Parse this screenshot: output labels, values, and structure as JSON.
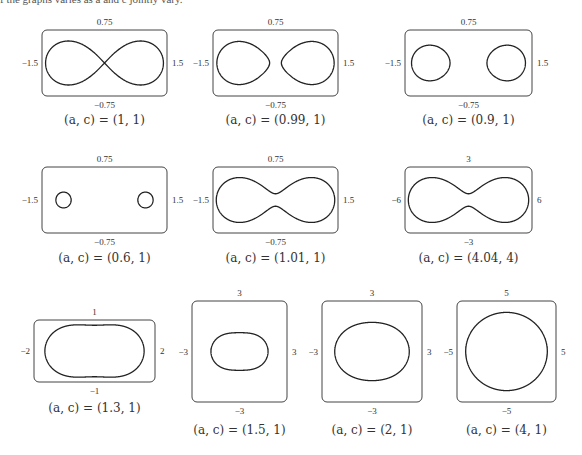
{
  "header": {
    "partial_text": "f the graphs varies as a and c jointly vary."
  },
  "chart_data": [
    {
      "type": "line",
      "title": "(a, c) = (1, 1)",
      "a": 1,
      "c": 1,
      "xlim": [
        -1.5,
        1.5
      ],
      "ylim": [
        -0.75,
        0.75
      ],
      "tick_labels": {
        "left": "−1.5",
        "right": "1.5",
        "top": "0.75",
        "bottom": "−0.75"
      },
      "caption": "(a, c) = (1, 1)"
    },
    {
      "type": "line",
      "title": "(a, c) = (0.99, 1)",
      "a": 0.99,
      "c": 1,
      "xlim": [
        -1.5,
        1.5
      ],
      "ylim": [
        -0.75,
        0.75
      ],
      "tick_labels": {
        "left": "−1.5",
        "right": "1.5",
        "top": "0.75",
        "bottom": "−0.75"
      },
      "caption": "(a, c) = (0.99, 1)"
    },
    {
      "type": "line",
      "title": "(a, c) = (0.9, 1)",
      "a": 0.9,
      "c": 1,
      "xlim": [
        -1.5,
        1.5
      ],
      "ylim": [
        -0.75,
        0.75
      ],
      "tick_labels": {
        "left": "−1.5",
        "right": "1.5",
        "top": "0.75",
        "bottom": "−0.75"
      },
      "caption": "(a, c) = (0.9, 1)"
    },
    {
      "type": "line",
      "title": "(a, c) = (0.6, 1)",
      "a": 0.6,
      "c": 1,
      "xlim": [
        -1.5,
        1.5
      ],
      "ylim": [
        -0.75,
        0.75
      ],
      "tick_labels": {
        "left": "−1.5",
        "right": "1.5",
        "top": "0.75",
        "bottom": "−0.75"
      },
      "caption": "(a, c) = (0.6, 1)"
    },
    {
      "type": "line",
      "title": "(a, c) = (1.01, 1)",
      "a": 1.01,
      "c": 1,
      "xlim": [
        -1.5,
        1.5
      ],
      "ylim": [
        -0.75,
        0.75
      ],
      "tick_labels": {
        "left": "−1.5",
        "right": "1.5",
        "top": "0.75",
        "bottom": "−0.75"
      },
      "caption": "(a, c) = (1.01, 1)"
    },
    {
      "type": "line",
      "title": "(a, c) = (4.04, 4)",
      "a": 4.04,
      "c": 4,
      "xlim": [
        -6,
        6
      ],
      "ylim": [
        -3,
        3
      ],
      "tick_labels": {
        "left": "−6",
        "right": "6",
        "top": "3",
        "bottom": "−3"
      },
      "caption": "(a, c) = (4.04, 4)"
    },
    {
      "type": "line",
      "title": "(a, c) = (1.3, 1)",
      "a": 1.3,
      "c": 1,
      "xlim": [
        -2,
        2
      ],
      "ylim": [
        -1,
        1
      ],
      "tick_labels": {
        "left": "−2",
        "right": "2",
        "top": "1",
        "bottom": "−1"
      },
      "caption": "(a, c) = (1.3, 1)"
    },
    {
      "type": "line",
      "title": "(a, c) = (1.5, 1)",
      "a": 1.5,
      "c": 1,
      "xlim": [
        -3,
        3
      ],
      "ylim": [
        -3,
        3
      ],
      "tick_labels": {
        "left": "−3",
        "right": "3",
        "top": "3",
        "bottom": "−3"
      },
      "caption": "(a, c) = (1.5, 1)"
    },
    {
      "type": "line",
      "title": "(a, c) = (2, 1)",
      "a": 2,
      "c": 1,
      "xlim": [
        -3,
        3
      ],
      "ylim": [
        -3,
        3
      ],
      "tick_labels": {
        "left": "−3",
        "right": "3",
        "top": "3",
        "bottom": "−3"
      },
      "caption": "(a, c) = (2, 1)"
    },
    {
      "type": "line",
      "title": "(a, c) = (4, 1)",
      "a": 4,
      "c": 1,
      "xlim": [
        -5,
        5
      ],
      "ylim": [
        -5,
        5
      ],
      "tick_labels": {
        "left": "−5",
        "right": "5",
        "top": "5",
        "bottom": "−5"
      },
      "caption": "(a, c) = (4, 1)"
    }
  ]
}
